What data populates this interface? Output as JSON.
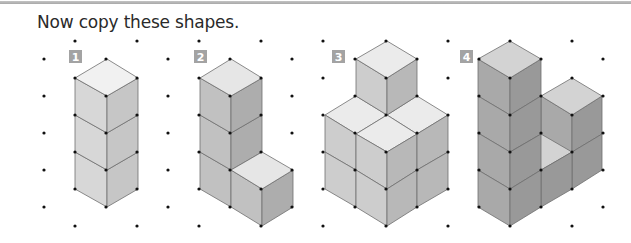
{
  "instruction": "Now copy these shapes.",
  "grid": {
    "dot_color": "#111111",
    "x0": 44,
    "dx": 31.05,
    "columns": 19,
    "even_rows_y": [
      59,
      96,
      133,
      170,
      207
    ],
    "odd_rows_y": [
      41,
      78,
      115,
      152,
      189,
      226
    ]
  },
  "colors": {
    "rule": "#b0b0b0",
    "badge": "#a3a3a3",
    "edge": "#6e6e6e"
  },
  "shapes": [
    {
      "label": "1",
      "badge": {
        "x": 69,
        "y": 50
      },
      "description": "Vertical column of 3 cubes",
      "palette": {
        "top": "#f1f1f1",
        "left": "#d7d7d7",
        "right": "#c6c6c6"
      },
      "faces": [
        {
          "type": "left",
          "points": "75,152 107,170 107,207 75,189"
        },
        {
          "type": "right",
          "points": "107,170 138,152 138,189 107,207"
        },
        {
          "type": "left",
          "points": "75,115 107,133 107,170 75,152"
        },
        {
          "type": "right",
          "points": "107,133 138,115 138,152 107,170"
        },
        {
          "type": "left",
          "points": "75,78 107,96 107,133 75,115"
        },
        {
          "type": "right",
          "points": "107,96 138,78 138,115 107,133"
        },
        {
          "type": "top",
          "points": "75,78 107,59 138,78 107,96"
        }
      ]
    },
    {
      "label": "2",
      "badge": {
        "x": 194,
        "y": 50
      },
      "description": "Column of 3 cubes with 1 cube in front at the bottom right",
      "palette": {
        "top": "#e6e6e6",
        "left": "#c1c1c1",
        "right": "#adadad"
      },
      "faces": [
        {
          "type": "left",
          "points": "200,152 231,170 231,207 200,189"
        },
        {
          "type": "left",
          "points": "200,115 231,133 231,170 200,152"
        },
        {
          "type": "right",
          "points": "231,133 262,115 262,152 231,170"
        },
        {
          "type": "left",
          "points": "200,78 231,96 231,133 200,115"
        },
        {
          "type": "right",
          "points": "231,96 262,78 262,115 231,133"
        },
        {
          "type": "top",
          "points": "200,78 231,59 262,78 231,96"
        },
        {
          "type": "left",
          "points": "231,170 262,189 262,226 231,207"
        },
        {
          "type": "right",
          "points": "262,189 293,170 293,207 262,226"
        },
        {
          "type": "top",
          "points": "231,170 262,152 293,170 262,189"
        }
      ]
    },
    {
      "label": "3",
      "badge": {
        "x": 332,
        "y": 50
      },
      "description": "2x2x2 block with one cube on top at the back",
      "palette": {
        "top": "#ebebeb",
        "left": "#cdcdcd",
        "right": "#b8b8b8"
      },
      "faces": [
        {
          "type": "top",
          "points": "325,115 356,96 387,115 356,134"
        },
        {
          "type": "top",
          "points": "387,115 417,96 448,115 417,134"
        },
        {
          "type": "left",
          "points": "356,59 387,78 387,115 356,96"
        },
        {
          "type": "right",
          "points": "387,78 417,59 417,96 387,115"
        },
        {
          "type": "top",
          "points": "356,59 387,41 417,59 387,78"
        },
        {
          "type": "top",
          "points": "356,134 387,115 417,134 387,152"
        },
        {
          "type": "left",
          "points": "325,115 356,134 356,170 325,152"
        },
        {
          "type": "left",
          "points": "356,134 387,152 387,189 356,170"
        },
        {
          "type": "left",
          "points": "325,152 356,170 356,207 325,189"
        },
        {
          "type": "left",
          "points": "356,170 387,189 387,226 356,207"
        },
        {
          "type": "right",
          "points": "387,152 417,134 417,170 387,189"
        },
        {
          "type": "right",
          "points": "417,134 448,115 448,152 417,170"
        },
        {
          "type": "right",
          "points": "387,189 417,170 417,207 387,226"
        },
        {
          "type": "right",
          "points": "417,170 448,152 448,189 417,207"
        }
      ]
    },
    {
      "label": "4",
      "badge": {
        "x": 460,
        "y": 50
      },
      "description": "Tower of 4 cubes, tower of 2 cubes behind right, 1 cube between at the bottom",
      "palette": {
        "top": "#d3d3d3",
        "left": "#a9a9a9",
        "right": "#999999"
      },
      "faces": [
        {
          "type": "left",
          "points": "541,96 572,115 572,189 541,170"
        },
        {
          "type": "right",
          "points": "572,115 602,96 602,134 572,152"
        },
        {
          "type": "right",
          "points": "572,152 602,134 602,170 572,189"
        },
        {
          "type": "top",
          "points": "541,96 572,78 602,96 572,115"
        },
        {
          "type": "top",
          "points": "510,152 541,134 572,152 541,170"
        },
        {
          "type": "right",
          "points": "541,170 572,152 572,189 541,207"
        },
        {
          "type": "left",
          "points": "478,59 510,78 510,115 478,96"
        },
        {
          "type": "left",
          "points": "478,96 510,115 510,152 478,133"
        },
        {
          "type": "left",
          "points": "478,133 510,152 510,189 478,170"
        },
        {
          "type": "left",
          "points": "478,170 510,189 510,226 478,207"
        },
        {
          "type": "right",
          "points": "510,78 541,59 541,96 510,115"
        },
        {
          "type": "right",
          "points": "510,115 541,96 541,134 510,152"
        },
        {
          "type": "right",
          "points": "510,152 541,134 541,170 510,189"
        },
        {
          "type": "right",
          "points": "510,189 541,170 541,207 510,226"
        },
        {
          "type": "top",
          "points": "478,59 510,41 541,59 510,78"
        }
      ]
    }
  ]
}
